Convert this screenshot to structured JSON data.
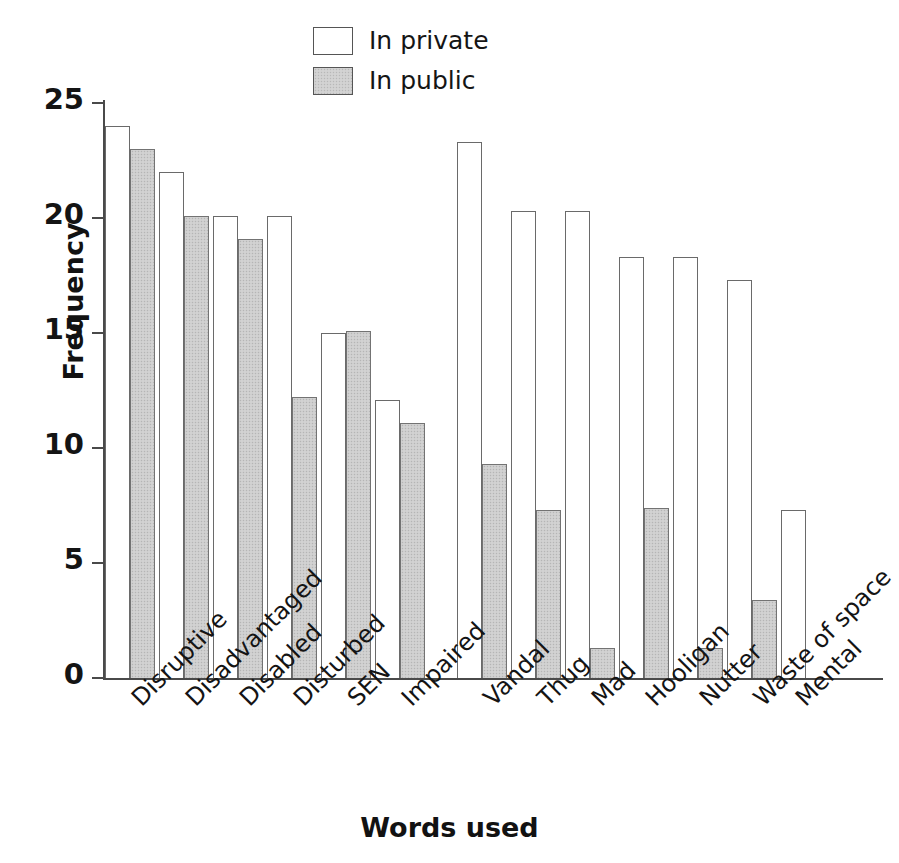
{
  "chart_data": {
    "type": "bar",
    "title": "",
    "xlabel": "Words used",
    "ylabel": "Frequency",
    "ylim": [
      0,
      25
    ],
    "yticks": [
      0,
      5,
      10,
      15,
      20,
      25
    ],
    "grid": false,
    "legend_position": "top-center",
    "categories": [
      "Disruptive",
      "Disadvantaged",
      "Disabled",
      "Disturbed",
      "SEN",
      "Impaired",
      "Vandal",
      "Thug",
      "Mad",
      "Hooligan",
      "Nutter",
      "Waste of space",
      "Mental"
    ],
    "group_break_after": "Impaired",
    "series": [
      {
        "name": "In private",
        "style": "white",
        "values": [
          24.0,
          22.0,
          20.1,
          20.1,
          15.0,
          12.1,
          23.3,
          20.3,
          20.3,
          18.3,
          18.3,
          17.3,
          7.3
        ]
      },
      {
        "name": "In public",
        "style": "gray",
        "values": [
          23.0,
          20.1,
          19.1,
          12.2,
          15.1,
          11.1,
          9.3,
          7.3,
          1.3,
          7.4,
          1.3,
          3.4,
          null
        ]
      }
    ]
  },
  "legend": {
    "items": [
      {
        "label": "In private",
        "style": "private"
      },
      {
        "label": "In public",
        "style": "public"
      }
    ]
  },
  "axes": {
    "y": {
      "label": "Frequency",
      "ticks": [
        "25",
        "20",
        "15",
        "10",
        "5",
        "0"
      ]
    },
    "x": {
      "label": "Words used"
    }
  }
}
